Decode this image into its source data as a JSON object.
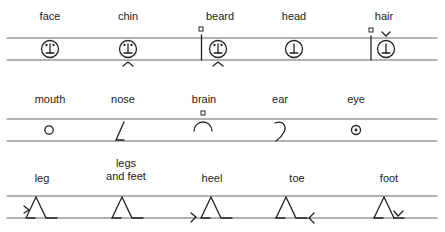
{
  "rows": [
    {
      "items": [
        {
          "label": "face",
          "symbol": "face-circle-icon"
        },
        {
          "label": "chin",
          "symbol": "chin-icon"
        },
        {
          "label": "beard",
          "symbol": "beard-icon"
        },
        {
          "label": "head",
          "symbol": "head-icon"
        },
        {
          "label": "hair",
          "symbol": "hair-icon"
        }
      ]
    },
    {
      "items": [
        {
          "label": "mouth",
          "symbol": "mouth-icon"
        },
        {
          "label": "nose",
          "symbol": "nose-icon"
        },
        {
          "label": "brain",
          "symbol": "brain-icon"
        },
        {
          "label": "ear",
          "symbol": "ear-icon"
        },
        {
          "label": "eye",
          "symbol": "eye-icon"
        }
      ]
    },
    {
      "items": [
        {
          "label": "leg",
          "symbol": "leg-icon"
        },
        {
          "label_line1": "legs",
          "label_line2": "and feet",
          "symbol": "legs-and-feet-icon"
        },
        {
          "label": "heel",
          "symbol": "heel-icon"
        },
        {
          "label": "toe",
          "symbol": "toe-icon"
        },
        {
          "label": "foot",
          "symbol": "foot-icon"
        }
      ]
    }
  ],
  "colors": {
    "ink": "#222222",
    "staff_line": "#555555"
  }
}
